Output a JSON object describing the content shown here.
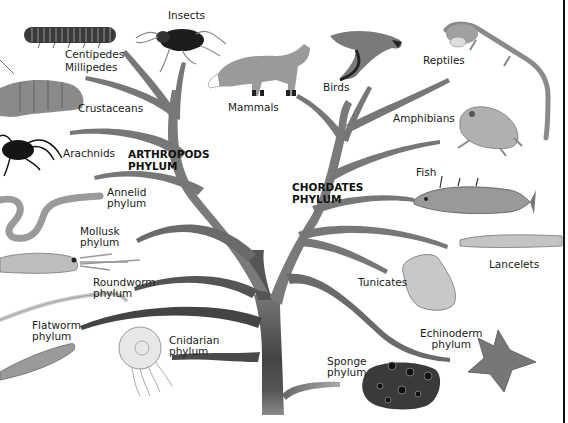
{
  "diagram": {
    "title_left": [
      "ARTHROPODS",
      "PHYLUM"
    ],
    "title_right": [
      "CHORDATES",
      "PHYLUM"
    ],
    "colors": {
      "trunk_dark": "#4a4a4a",
      "branch": "#7a7a7a",
      "branch_light": "#9a9a9a",
      "text": "#1a1a1a",
      "border": "#111111"
    },
    "labels": {
      "insects": "Insects",
      "centipedes": "Centipedes",
      "millipedes": "Millipedes",
      "crustaceans": "Crustaceans",
      "arachnids": "Arachnids",
      "mammals": "Mammals",
      "birds": "Birds",
      "reptiles": "Reptiles",
      "amphibians": "Amphibians",
      "fish": "Fish",
      "lancelets": "Lancelets",
      "tunicates": "Tunicates",
      "annelid_1": "Annelid",
      "annelid_2": "phylum",
      "mollusk_1": "Mollusk",
      "mollusk_2": "phylum",
      "roundworm_1": "Roundworm",
      "roundworm_2": "phylum",
      "flatworm_1": "Flatworm",
      "flatworm_2": "phylum",
      "cnidarian_1": "Cnidarian",
      "cnidarian_2": "phylum",
      "echinoderm_1": "Echinoderm",
      "echinoderm_2": "phylum",
      "sponge_1": "Sponge",
      "sponge_2": "phylum"
    }
  }
}
